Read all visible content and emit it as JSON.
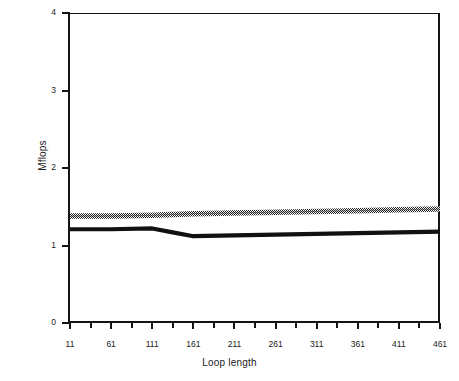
{
  "chart_data": {
    "type": "line",
    "title": "",
    "xlabel": "Loop length",
    "ylabel": "Mflops",
    "xlim": [
      11,
      461
    ],
    "ylim": [
      0,
      4
    ],
    "grid": false,
    "legend": "none",
    "x_ticks": [
      11,
      61,
      111,
      161,
      211,
      261,
      311,
      361,
      411,
      461
    ],
    "x_tick_labels": [
      "11",
      "61",
      "111",
      "161",
      "211",
      "261",
      "311",
      "361",
      "411",
      "461"
    ],
    "y_ticks": [
      0,
      1,
      2,
      3,
      4
    ],
    "y_tick_labels": [
      "0",
      "1",
      "2",
      "3",
      "4"
    ],
    "x": [
      11,
      61,
      111,
      136,
      161,
      211,
      261,
      311,
      361,
      411,
      461
    ],
    "series": [
      {
        "name": "upper-series",
        "style": "dithered-gray-thick",
        "color": "#555555",
        "values": [
          1.38,
          1.38,
          1.39,
          1.4,
          1.41,
          1.42,
          1.43,
          1.44,
          1.45,
          1.46,
          1.47
        ]
      },
      {
        "name": "lower-series",
        "style": "solid-black-thick",
        "color": "#111111",
        "values": [
          1.21,
          1.21,
          1.22,
          1.17,
          1.12,
          1.13,
          1.14,
          1.15,
          1.16,
          1.17,
          1.18
        ]
      }
    ]
  },
  "axes": {
    "x_title": "Loop length",
    "y_title": "Mflops"
  }
}
